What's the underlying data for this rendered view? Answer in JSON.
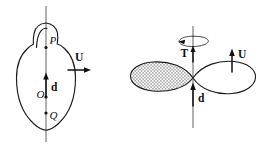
{
  "figure": {
    "title": "",
    "background_color": "#ffffff",
    "ink_color": "#111111",
    "panels": [
      {
        "id": "left-panel",
        "name": "equilibrium-tidal-bulge-figure",
        "shape": "teardrop-egg-body-with-polar-bulge",
        "points": [
          {
            "label": "P",
            "style": "italic",
            "role": "upper-point-on-axis"
          },
          {
            "label": "O",
            "style": "italic",
            "role": "center-point-on-axis"
          },
          {
            "label": "Q",
            "style": "italic",
            "role": "lower-point-on-axis"
          }
        ],
        "vectors": [
          {
            "label": "d",
            "style": "bold",
            "direction": "up",
            "role": "separation-vector-along-axis"
          },
          {
            "label": "U",
            "style": "bold",
            "direction": "right",
            "role": "velocity-vector"
          }
        ],
        "axis": {
          "orientation": "vertical",
          "style": "thin-line"
        }
      },
      {
        "id": "right-panel",
        "name": "lemniscate-two-lobe-figure",
        "shape": "figure-eight-two-lobes",
        "lobes": [
          {
            "side": "left",
            "fill": "stippled-dots",
            "fill_color": "#ffffff",
            "dot_color": "#333333"
          },
          {
            "side": "right",
            "fill": "none",
            "fill_color": "#ffffff"
          }
        ],
        "vectors": [
          {
            "label": "T",
            "style": "bold",
            "direction": "up",
            "role": "torque-or-tension-vector"
          },
          {
            "label": "d",
            "style": "bold",
            "direction": "up",
            "role": "separation-vector-along-axis"
          },
          {
            "label": "U",
            "style": "bold",
            "direction": "up",
            "role": "velocity-vector"
          }
        ],
        "rotation_indicator": {
          "label": "",
          "shape": "ellipse-with-arrowhead",
          "direction": "counterclockwise-viewed-from-above",
          "role": "spin-about-vertical-axis"
        },
        "axis": {
          "orientation": "vertical",
          "style": "thin-line"
        }
      }
    ]
  }
}
